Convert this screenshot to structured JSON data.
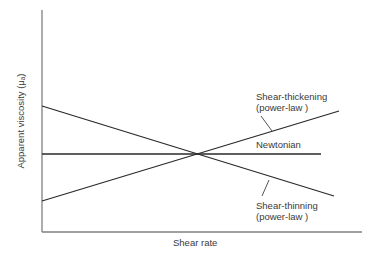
{
  "diagram": {
    "y_axis_label": "Apparent viscosity (μₐ)",
    "x_axis_label": "Shear rate",
    "curves": [
      {
        "name": "Shear-thickening",
        "label_line1": "Shear-thickening",
        "label_line2": "(power-law )",
        "trend": "increasing"
      },
      {
        "name": "Newtonian",
        "label_line1": "Newtonian",
        "trend": "constant"
      },
      {
        "name": "Shear-thinning",
        "label_line1": "Shear-thinning",
        "label_line2": "(power-law )",
        "trend": "decreasing"
      }
    ],
    "colors": {
      "line": "#2a2a2a",
      "axis": "#7a7a7a",
      "text": "#3a3a3a"
    }
  }
}
